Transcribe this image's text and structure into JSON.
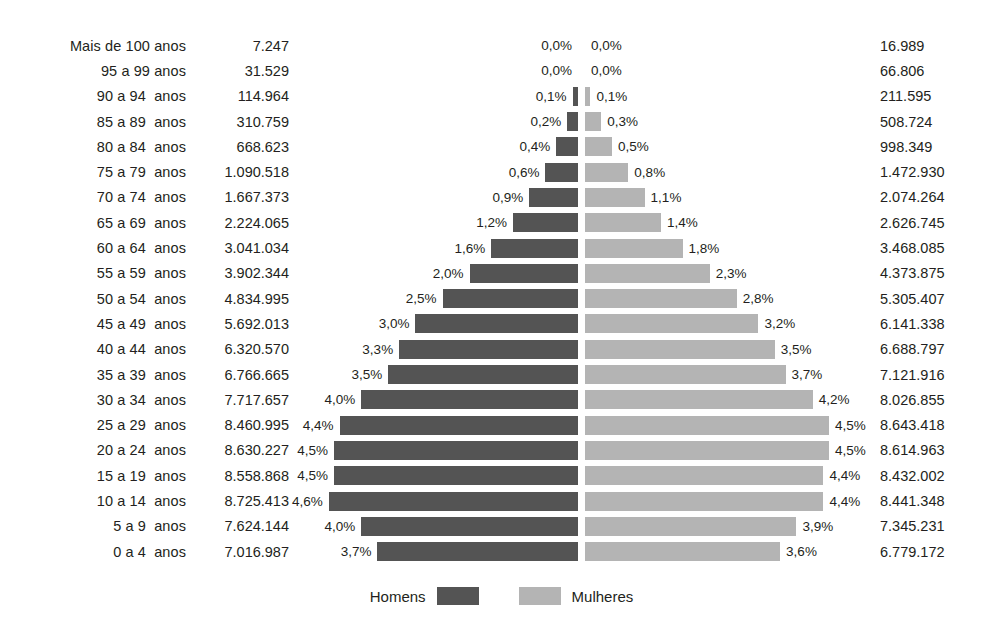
{
  "chart_data": {
    "type": "bar",
    "subtype": "population-pyramid",
    "title": "",
    "xlabel": "",
    "ylabel": "",
    "orientation": "horizontal-diverging",
    "grid": false,
    "legend_position": "bottom-center",
    "axis_max_percent": 4.6,
    "colors": {
      "male": "#545454",
      "female": "#b4b4b4",
      "text": "#231f20",
      "background": "#ffffff"
    },
    "legend": [
      {
        "label": "Homens",
        "color": "#545454"
      },
      {
        "label": "Mulheres",
        "color": "#b4b4b4"
      }
    ],
    "categories": [
      "Mais de 100 anos",
      "95 a 99 anos",
      "90 a 94  anos",
      "85 a 89  anos",
      "80 a 84  anos",
      "75 a 79  anos",
      "70 a 74  anos",
      "65 a 69  anos",
      "60 a 64  anos",
      "55 a 59  anos",
      "50 a 54  anos",
      "45 a 49  anos",
      "40 a 44  anos",
      "35 a 39  anos",
      "30 a 34  anos",
      "25 a 29  anos",
      "20 a 24  anos",
      "15 a 19  anos",
      "10 a 14  anos",
      "5 a 9  anos",
      "0 a 4  anos"
    ],
    "series": [
      {
        "name": "Homens",
        "side": "left",
        "color": "#545454",
        "percent_labels": [
          "0,0%",
          "0,0%",
          "0,1%",
          "0,2%",
          "0,4%",
          "0,6%",
          "0,9%",
          "1,2%",
          "1,6%",
          "2,0%",
          "2,5%",
          "3,0%",
          "3,3%",
          "3,5%",
          "4,0%",
          "4,4%",
          "4,5%",
          "4,5%",
          "4,6%",
          "4,0%",
          "3,7%"
        ],
        "percent_values": [
          0.0,
          0.0,
          0.1,
          0.2,
          0.4,
          0.6,
          0.9,
          1.2,
          1.6,
          2.0,
          2.5,
          3.0,
          3.3,
          3.5,
          4.0,
          4.4,
          4.5,
          4.5,
          4.6,
          4.0,
          3.7
        ],
        "count_labels": [
          "7.247",
          "31.529",
          "114.964",
          "310.759",
          "668.623",
          "1.090.518",
          "1.667.373",
          "2.224.065",
          "3.041.034",
          "3.902.344",
          "4.834.995",
          "5.692.013",
          "6.320.570",
          "6.766.665",
          "7.717.657",
          "8.460.995",
          "8.630.227",
          "8.558.868",
          "8.725.413",
          "7.624.144",
          "7.016.987"
        ],
        "count_values": [
          7247,
          31529,
          114964,
          310759,
          668623,
          1090518,
          1667373,
          2224065,
          3041034,
          3902344,
          4834995,
          5692013,
          6320570,
          6766665,
          7717657,
          8460995,
          8630227,
          8558868,
          8725413,
          7624144,
          7016987
        ]
      },
      {
        "name": "Mulheres",
        "side": "right",
        "color": "#b4b4b4",
        "percent_labels": [
          "0,0%",
          "0,0%",
          "0,1%",
          "0,3%",
          "0,5%",
          "0,8%",
          "1,1%",
          "1,4%",
          "1,8%",
          "2,3%",
          "2,8%",
          "3,2%",
          "3,5%",
          "3,7%",
          "4,2%",
          "4,5%",
          "4,5%",
          "4,4%",
          "4,4%",
          "3,9%",
          "3,6%"
        ],
        "percent_values": [
          0.0,
          0.0,
          0.1,
          0.3,
          0.5,
          0.8,
          1.1,
          1.4,
          1.8,
          2.3,
          2.8,
          3.2,
          3.5,
          3.7,
          4.2,
          4.5,
          4.5,
          4.4,
          4.4,
          3.9,
          3.6
        ],
        "count_labels": [
          "16.989",
          "66.806",
          "211.595",
          "508.724",
          "998.349",
          "1.472.930",
          "2.074.264",
          "2.626.745",
          "3.468.085",
          "4.373.875",
          "5.305.407",
          "6.141.338",
          "6.688.797",
          "7.121.916",
          "8.026.855",
          "8.643.418",
          "8.614.963",
          "8.432.002",
          "8.441.348",
          "7.345.231",
          "6.779.172"
        ],
        "count_values": [
          16989,
          66806,
          211595,
          508724,
          998349,
          1472930,
          2074264,
          2626745,
          3468085,
          4373875,
          5305407,
          6141338,
          6688797,
          7121916,
          8026855,
          8643418,
          8614963,
          8432002,
          8441348,
          7345231,
          6779172
        ]
      }
    ]
  }
}
